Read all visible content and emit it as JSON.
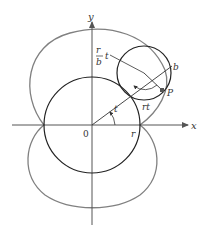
{
  "diagram": {
    "labels": {
      "y_axis": "y",
      "x_axis": "x",
      "origin": "0",
      "fixed_radius": "r",
      "angle_t": "t",
      "frac_num": "r",
      "frac_den": "b",
      "frac_t": "t",
      "rolling_radius": "b",
      "point": "P",
      "arc_rt": "rt"
    },
    "colors": {
      "axes": "#555555",
      "fixed_circle": "#222222",
      "rolling_circle": "#222222",
      "curve": "#808080",
      "text": "#333333"
    }
  }
}
